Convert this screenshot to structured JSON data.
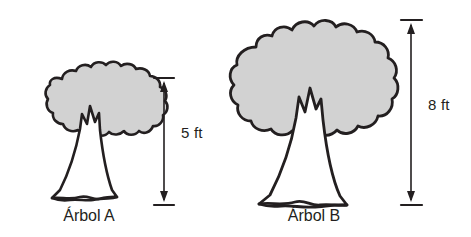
{
  "figure": {
    "background_color": "#ffffff",
    "outline_color": "#231f20",
    "canopy_fill_color": "#d2d2d2",
    "trunk_fill_color": "#ffffff"
  },
  "trees": [
    {
      "id": "tree-a",
      "caption": "Árbol A",
      "height_label": "5 ft",
      "height_value": 5,
      "height_unit": "ft"
    },
    {
      "id": "tree-b",
      "caption": "Árbol B",
      "height_label": "8 ft",
      "height_value": 8,
      "height_unit": "ft"
    }
  ],
  "dimensions": [
    {
      "id": "dimension-a",
      "label": "5 ft",
      "for_tree": "Árbol A",
      "arrow_style": "double-headed",
      "tick_marks": "top-and-bottom"
    },
    {
      "id": "dimension-b",
      "label": "8 ft",
      "for_tree": "Árbol B",
      "arrow_style": "double-headed",
      "tick_marks": "top-and-bottom"
    }
  ]
}
